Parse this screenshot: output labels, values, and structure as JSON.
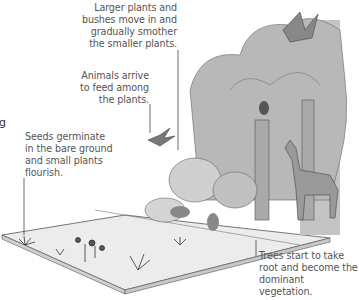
{
  "diagram": {
    "edge_fragment": "g",
    "stages": [
      {
        "id": "pioneer",
        "label": "Seeds germinate in the bare ground and small plants flourish.",
        "lines": [
          "Seeds germinate",
          "in the bare ground",
          "and small plants",
          "flourish."
        ]
      },
      {
        "id": "animals",
        "label": "Animals arrive to feed among the plants.",
        "lines": [
          "Animals arrive",
          "to feed among",
          "the plants."
        ]
      },
      {
        "id": "shrubs",
        "label": "Larger plants and bushes move in and gradually smother the smaller plants.",
        "lines": [
          "Larger plants and",
          "bushes move in and",
          "gradually smother",
          "the smaller plants."
        ]
      },
      {
        "id": "forest",
        "label": "Trees start to take root and become the dominant vegetation.",
        "lines": [
          "Trees start to take",
          "root and become the",
          "dominant vegetation."
        ]
      }
    ],
    "colors": {
      "ground": "#e6e6e6",
      "ground_edge": "#555555",
      "foliage": "#b8b8b8",
      "trunk": "#a9a9a9",
      "text": "#555555"
    }
  }
}
